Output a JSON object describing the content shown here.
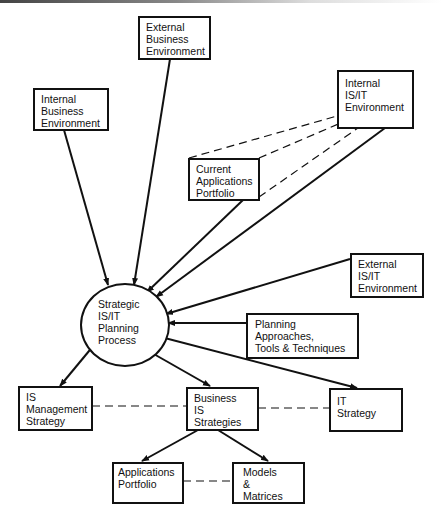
{
  "diagram": {
    "type": "flowchart",
    "center": {
      "id": "planning_process",
      "lines": [
        "Strategic",
        "IS/IT",
        "Planning",
        "Process"
      ]
    },
    "inputs": [
      {
        "id": "external_business",
        "lines": [
          "External",
          "Business",
          "Environment"
        ]
      },
      {
        "id": "internal_business",
        "lines": [
          "Internal",
          "Business",
          "Environment"
        ]
      },
      {
        "id": "internal_isit",
        "lines": [
          "Internal",
          "IS/IT",
          "Environment"
        ]
      },
      {
        "id": "current_apps",
        "lines": [
          "Current",
          "Applications",
          "Portfolio"
        ]
      },
      {
        "id": "external_isit",
        "lines": [
          "External",
          "IS/IT",
          "Environment"
        ]
      },
      {
        "id": "planning_approaches",
        "lines": [
          "Planning",
          "Approaches,",
          "Tools & Techniques"
        ]
      }
    ],
    "outputs": [
      {
        "id": "is_management",
        "lines": [
          "IS",
          "Management",
          "Strategy"
        ]
      },
      {
        "id": "business_is",
        "lines": [
          "Business",
          "IS",
          "Strategies"
        ]
      },
      {
        "id": "it_strategy",
        "lines": [
          "IT",
          "Strategy"
        ]
      }
    ],
    "sub_outputs": [
      {
        "id": "apps_portfolio",
        "lines": [
          "Applications",
          "Portfolio"
        ]
      },
      {
        "id": "models_matrices",
        "lines": [
          "Models",
          "&",
          "Matrices"
        ]
      }
    ],
    "edges": [
      {
        "from": "external_business",
        "to": "planning_process",
        "style": "solid-arrow"
      },
      {
        "from": "internal_business",
        "to": "planning_process",
        "style": "solid-arrow"
      },
      {
        "from": "internal_isit",
        "to": "planning_process",
        "style": "solid-arrow"
      },
      {
        "from": "current_apps",
        "to": "planning_process",
        "style": "solid-arrow"
      },
      {
        "from": "current_apps",
        "to": "internal_isit",
        "style": "dashed"
      },
      {
        "from": "external_isit",
        "to": "planning_process",
        "style": "solid-arrow"
      },
      {
        "from": "planning_approaches",
        "to": "planning_process",
        "style": "solid-arrow"
      },
      {
        "from": "planning_process",
        "to": "is_management",
        "style": "solid-arrow"
      },
      {
        "from": "planning_process",
        "to": "business_is",
        "style": "solid-arrow"
      },
      {
        "from": "planning_process",
        "to": "it_strategy",
        "style": "solid-arrow"
      },
      {
        "from": "is_management",
        "to": "business_is",
        "style": "dashed"
      },
      {
        "from": "business_is",
        "to": "it_strategy",
        "style": "dashed"
      },
      {
        "from": "business_is",
        "to": "apps_portfolio",
        "style": "solid-arrow"
      },
      {
        "from": "business_is",
        "to": "models_matrices",
        "style": "solid-arrow"
      },
      {
        "from": "apps_portfolio",
        "to": "models_matrices",
        "style": "dashed"
      }
    ],
    "colors": {
      "line": "#111111",
      "background": "#ffffff"
    }
  }
}
